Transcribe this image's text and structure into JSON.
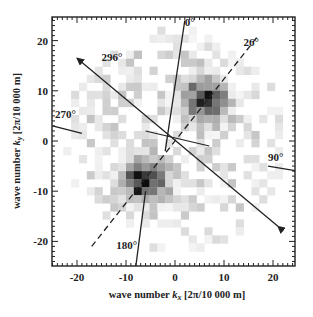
{
  "chart_data": {
    "type": "heatmap",
    "title": "",
    "xlabel": "wave number k_x [2π/10 000 m]",
    "ylabel": "wave number k_y [2π/10 000 m]",
    "xlabel_parts": {
      "prefix": "wave number ",
      "var": "k",
      "sub": "x",
      "suffix": " [2π/10 000 m]"
    },
    "ylabel_parts": {
      "prefix": "wave number ",
      "var": "k",
      "sub": "y",
      "suffix": " [2π/10 000 m]"
    },
    "xlim": [
      -25,
      25
    ],
    "ylim": [
      -25,
      25
    ],
    "xticks": [
      -20,
      -10,
      0,
      10,
      20
    ],
    "yticks": [
      -20,
      -10,
      0,
      10,
      20
    ],
    "grid": false,
    "colormap": "grayscale (white = low, black = high)",
    "peaks": [
      {
        "kx": 6,
        "ky": 8,
        "intensity": 1.0
      },
      {
        "kx": -6,
        "ky": -8,
        "intensity": 1.0
      }
    ],
    "direction_lines": [
      {
        "label": "0°",
        "angle_deg": 0,
        "style": "solid",
        "from": [
          -2,
          -2
        ],
        "to": [
          2,
          24
        ],
        "label_at": [
          2,
          23
        ]
      },
      {
        "label": "26°",
        "angle_deg": 26,
        "style": "dashed",
        "from": [
          -17,
          -21
        ],
        "to": [
          17,
          21
        ],
        "label_at": [
          14,
          19
        ]
      },
      {
        "label": "90°",
        "angle_deg": 90,
        "style": "solid",
        "from": [
          19,
          -5
        ],
        "to": [
          25,
          -6
        ],
        "label_at": [
          19,
          -4
        ]
      },
      {
        "label": "180°",
        "angle_deg": 180,
        "style": "solid",
        "from": [
          -6,
          -10
        ],
        "to": [
          -8,
          -25
        ],
        "label_at": [
          -12,
          -21.5
        ]
      },
      {
        "label": "270°",
        "angle_deg": 270,
        "style": "solid",
        "from": [
          -25,
          3
        ],
        "to": [
          -19,
          1.5
        ],
        "label_at": [
          -24.5,
          4.5
        ]
      },
      {
        "label": "296°",
        "angle_deg": 296,
        "style": "arrow",
        "from": [
          21,
          -17
        ],
        "to": [
          -20,
          16.5
        ],
        "label_at": [
          -15,
          16
        ]
      }
    ],
    "cross_lines": [
      {
        "from": [
          -6,
          2
        ],
        "to": [
          7,
          -1
        ]
      }
    ]
  }
}
